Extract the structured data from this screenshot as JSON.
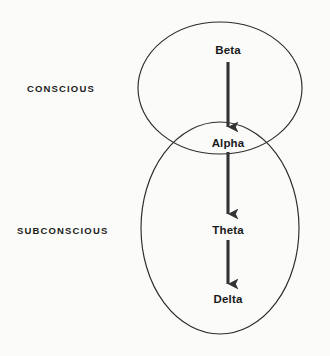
{
  "diagram": {
    "type": "venn-flow",
    "background_color": "#fbfbfa",
    "stroke_color": "#2b2b2b",
    "arrow_color": "#333333",
    "text_color": "#1a1a1a"
  },
  "regions": [
    {
      "id": "conscious",
      "label": "CONSCIOUS",
      "shape": "ellipse",
      "cx": 220,
      "cy": 88,
      "rx": 82,
      "ry": 66
    },
    {
      "id": "subconscious",
      "label": "SUBCONSCIOUS",
      "shape": "ellipse",
      "cx": 220,
      "cy": 228,
      "rx": 79,
      "ry": 106
    }
  ],
  "nodes": [
    {
      "id": "beta",
      "label": "Beta",
      "region": "conscious",
      "x": 228,
      "y": 52
    },
    {
      "id": "alpha",
      "label": "Alpha",
      "region": "overlap",
      "x": 228,
      "y": 145
    },
    {
      "id": "theta",
      "label": "Theta",
      "region": "subconscious",
      "x": 228,
      "y": 232
    },
    {
      "id": "delta",
      "label": "Delta",
      "region": "subconscious",
      "x": 228,
      "y": 301
    }
  ],
  "arrows": [
    {
      "id": "beta-to-alpha",
      "from": "beta",
      "to": "alpha",
      "x": 228,
      "y1": 62,
      "y2": 131
    },
    {
      "id": "alpha-to-theta",
      "from": "alpha",
      "to": "theta",
      "x": 228,
      "y1": 152,
      "y2": 218
    },
    {
      "id": "theta-to-delta",
      "from": "theta",
      "to": "delta",
      "x": 228,
      "y1": 240,
      "y2": 288
    }
  ]
}
